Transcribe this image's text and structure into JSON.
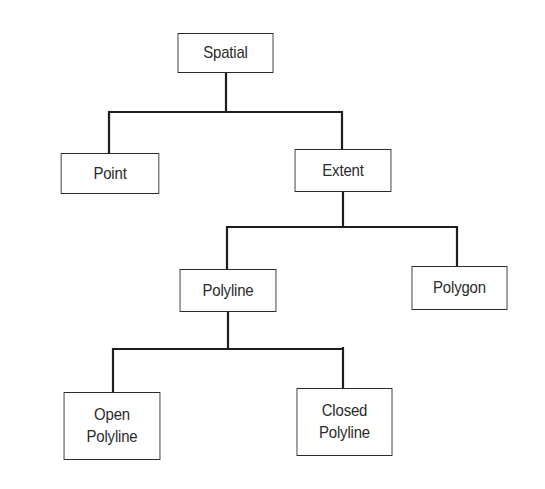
{
  "diagram": {
    "type": "hierarchy-tree",
    "colors": {
      "background": "#ffffff",
      "line": "#1e1e1e",
      "box_border": "#2a2a2a",
      "text": "#2b2b2b"
    },
    "nodes": {
      "spatial": {
        "label": "Spatial",
        "line2": ""
      },
      "point": {
        "label": "Point",
        "line2": ""
      },
      "extent": {
        "label": "Extent",
        "line2": ""
      },
      "polyline": {
        "label": "Polyline",
        "line2": ""
      },
      "polygon": {
        "label": "Polygon",
        "line2": ""
      },
      "open_polyline": {
        "label": "Open",
        "line2": "Polyline"
      },
      "closed_polyline": {
        "label": "Closed",
        "line2": "Polyline"
      }
    },
    "edges": [
      {
        "from": "Spatial",
        "to": "Point"
      },
      {
        "from": "Spatial",
        "to": "Extent"
      },
      {
        "from": "Extent",
        "to": "Polyline"
      },
      {
        "from": "Extent",
        "to": "Polygon"
      },
      {
        "from": "Polyline",
        "to": "Open Polyline"
      },
      {
        "from": "Polyline",
        "to": "Closed Polyline"
      }
    ]
  }
}
